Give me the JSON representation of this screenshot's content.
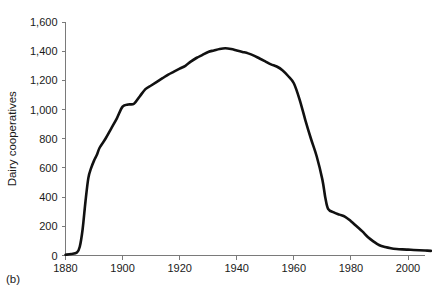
{
  "figure": {
    "panel_label": "(b)",
    "background_color": "#ffffff",
    "line_color": "#111111",
    "axis_color": "#7a7a7a"
  },
  "chart_data": {
    "type": "line",
    "title": "",
    "xlabel": "",
    "ylabel": "Dairy cooperatives",
    "xlim": [
      1880,
      2010
    ],
    "ylim": [
      0,
      1600
    ],
    "xticks": [
      1880,
      1900,
      1920,
      1940,
      1960,
      1980,
      2000
    ],
    "xtick_labels": [
      "1880",
      "1900",
      "1920",
      "1940",
      "1960",
      "1980",
      "2000"
    ],
    "yticks": [
      0,
      200,
      400,
      600,
      800,
      1000,
      1200,
      1400,
      1600
    ],
    "ytick_labels": [
      "0",
      "200",
      "400",
      "600",
      "800",
      "1,000",
      "1,200",
      "1,400",
      "1,600"
    ],
    "grid": false,
    "legend": null,
    "series": [
      {
        "name": "Dairy cooperatives",
        "x": [
          1880,
          1882,
          1884,
          1885,
          1886,
          1887,
          1888,
          1889,
          1890,
          1891,
          1892,
          1894,
          1896,
          1898,
          1900,
          1902,
          1904,
          1906,
          1908,
          1910,
          1912,
          1914,
          1916,
          1918,
          1920,
          1922,
          1924,
          1926,
          1928,
          1930,
          1932,
          1934,
          1936,
          1938,
          1940,
          1942,
          1944,
          1946,
          1948,
          1950,
          1952,
          1954,
          1956,
          1958,
          1960,
          1962,
          1964,
          1966,
          1968,
          1970,
          1971,
          1972,
          1974,
          1976,
          1978,
          1980,
          1982,
          1984,
          1986,
          1988,
          1990,
          1992,
          1994,
          1996,
          1998,
          2000,
          2002,
          2004,
          2006,
          2008
        ],
        "y": [
          5,
          10,
          20,
          60,
          180,
          370,
          530,
          600,
          650,
          690,
          740,
          800,
          870,
          940,
          1020,
          1035,
          1040,
          1090,
          1140,
          1165,
          1190,
          1215,
          1240,
          1260,
          1280,
          1300,
          1330,
          1355,
          1375,
          1395,
          1405,
          1415,
          1420,
          1415,
          1405,
          1395,
          1385,
          1370,
          1350,
          1330,
          1310,
          1295,
          1270,
          1230,
          1180,
          1070,
          930,
          800,
          680,
          520,
          400,
          320,
          295,
          280,
          265,
          235,
          200,
          165,
          125,
          95,
          70,
          58,
          50,
          45,
          42,
          40,
          38,
          36,
          34,
          32
        ]
      }
    ]
  }
}
